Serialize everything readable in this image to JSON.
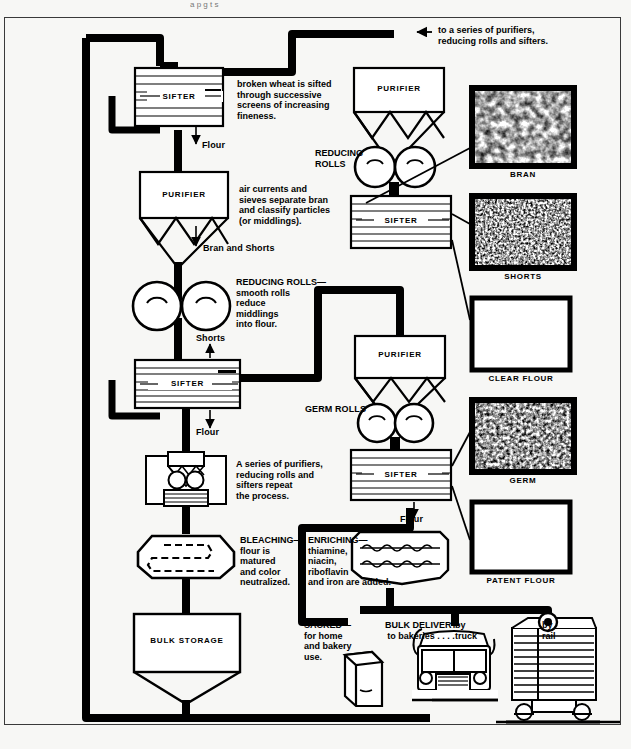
{
  "diagram": {
    "top_cut_text": "a  p  g        t          s",
    "colors": {
      "ink": "#000000",
      "paper": "#f7f7f5",
      "frame": "#3a3a3a"
    }
  },
  "equipment": {
    "sifter_1": "SIFTER",
    "sifter_2": "SIFTER",
    "sifter_3": "SIFTER",
    "sifter_4": "SIFTER",
    "purifier_left": "PURIFIER",
    "purifier_top_right": "PURIFIER",
    "purifier_mid_right": "PURIFIER",
    "bulk_storage": "BULK STORAGE"
  },
  "flow_labels": {
    "flour_1": "Flour",
    "flour_2": "Flour",
    "flour_3": "Flour",
    "bran_and_shorts": "Bran and Shorts",
    "shorts": "Shorts",
    "reducing_rolls_right": "REDUCING\nROLLS",
    "germ_rolls": "GERM ROLLS"
  },
  "captions": {
    "sifted": "broken wheat is sifted\nthrough successive\nscreens of increasing\nfineness.",
    "purifier": "air currents and\nsieves separate bran\nand classify particles\n(or middlings).",
    "reducing_rolls": "REDUCING ROLLS—\nsmooth rolls\nreduce\nmiddlings\ninto flour.",
    "series_repeat": "A series of purifiers,\nreducing rolls and\nsifters repeat\nthe process.",
    "bleaching": "BLEACHING—\nflour is\nmatured\nand color\nneutralized.",
    "enriching": "ENRICHING—\nthiamine,\nniacin,\nriboflavin\nand iron are added.",
    "sacked": "SACKED—\nfor home\nand bakery\nuse.",
    "to_series": "to a series of purifiers,\nreducing rolls and sifters.",
    "bulk_delivery": "BULK DELIVERY\nto bakeries . . . .",
    "by_truck": "by\ntruck",
    "by_rail": "by\nrail"
  },
  "swatches": [
    {
      "name": "BRAN",
      "texture": "coarse"
    },
    {
      "name": "SHORTS",
      "texture": "fine"
    },
    {
      "name": "CLEAR FLOUR",
      "texture": "blank"
    },
    {
      "name": "GERM",
      "texture": "medium"
    },
    {
      "name": "PATENT FLOUR",
      "texture": "blank"
    }
  ]
}
